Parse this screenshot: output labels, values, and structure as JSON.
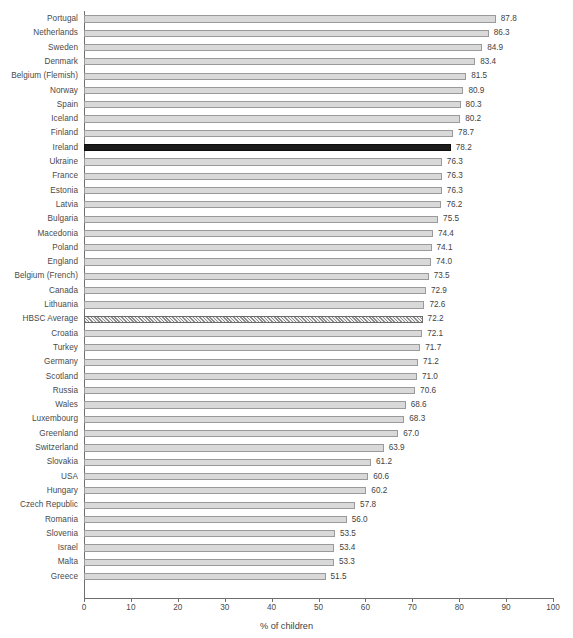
{
  "chart_data": {
    "type": "bar",
    "orientation": "horizontal",
    "title": "",
    "subtitle": "",
    "xlabel": "% of children",
    "ylabel": "",
    "xlim": [
      0,
      100
    ],
    "xticks": [
      0,
      10,
      20,
      30,
      40,
      50,
      60,
      70,
      80,
      90,
      100
    ],
    "grid": false,
    "legend": "none",
    "bar_style": {
      "default_fill": "#d9d9d9",
      "default_border": "#9a9a9a",
      "highlight_fill": "#1c1c1c",
      "average_pattern": "diagonal-hatch"
    },
    "categories": [
      "Portugal",
      "Netherlands",
      "Sweden",
      "Denmark",
      "Belgium (Flemish)",
      "Norway",
      "Spain",
      "Iceland",
      "Finland",
      "Ireland",
      "Ukraine",
      "France",
      "Estonia",
      "Latvia",
      "Bulgaria",
      "Macedonia",
      "Poland",
      "England",
      "Belgium (French)",
      "Canada",
      "Lithuania",
      "HBSC Average",
      "Croatia",
      "Turkey",
      "Germany",
      "Scotland",
      "Russia",
      "Wales",
      "Luxembourg",
      "Greenland",
      "Switzerland",
      "Slovakia",
      "USA",
      "Hungary",
      "Czech Republic",
      "Romania",
      "Slovenia",
      "Israel",
      "Malta",
      "Greece"
    ],
    "values": [
      87.8,
      86.3,
      84.9,
      83.4,
      81.5,
      80.9,
      80.3,
      80.2,
      78.7,
      78.2,
      76.3,
      76.3,
      76.3,
      76.2,
      75.5,
      74.4,
      74.1,
      74.0,
      73.5,
      72.9,
      72.6,
      72.2,
      72.1,
      71.7,
      71.2,
      71.0,
      70.6,
      68.6,
      68.3,
      67.0,
      63.9,
      61.2,
      60.6,
      60.2,
      57.8,
      56.0,
      53.5,
      53.4,
      53.3,
      51.5
    ],
    "value_labels": [
      "87.8",
      "86.3",
      "84.9",
      "83.4",
      "81.5",
      "80.9",
      "80.3",
      "80.2",
      "78.7",
      "78.2",
      "76.3",
      "76.3",
      "76.3",
      "76.2",
      "75.5",
      "74.4",
      "74.1",
      "74.0",
      "73.5",
      "72.9",
      "72.6",
      "72.2",
      "72.1",
      "71.7",
      "71.2",
      "71.0",
      "70.6",
      "68.6",
      "68.3",
      "67.0",
      "63.9",
      "61.2",
      "60.6",
      "60.2",
      "57.8",
      "56.0",
      "53.5",
      "53.4",
      "53.3",
      "51.5"
    ],
    "styles": [
      "default",
      "default",
      "default",
      "default",
      "default",
      "default",
      "default",
      "default",
      "default",
      "highlight",
      "default",
      "default",
      "default",
      "default",
      "default",
      "default",
      "default",
      "default",
      "default",
      "default",
      "default",
      "average",
      "default",
      "default",
      "default",
      "default",
      "default",
      "default",
      "default",
      "default",
      "default",
      "default",
      "default",
      "default",
      "default",
      "default",
      "default",
      "default",
      "default",
      "default"
    ]
  }
}
